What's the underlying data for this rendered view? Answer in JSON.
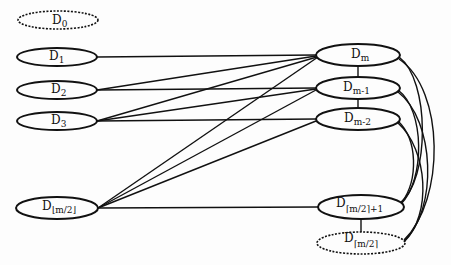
{
  "diagram": {
    "type": "bipartite-graph",
    "left_nodes": [
      {
        "id": "D0",
        "base": "D",
        "sub": "0",
        "style": "dashed"
      },
      {
        "id": "D1",
        "base": "D",
        "sub": "1",
        "style": "solid"
      },
      {
        "id": "D2",
        "base": "D",
        "sub": "2",
        "style": "solid"
      },
      {
        "id": "D3",
        "base": "D",
        "sub": "3",
        "style": "solid"
      },
      {
        "id": "Dfloor",
        "base": "D",
        "sub": "⌊m/2⌋",
        "style": "solid"
      }
    ],
    "right_nodes": [
      {
        "id": "Dm",
        "base": "D",
        "sub": "m",
        "style": "solid"
      },
      {
        "id": "Dm1",
        "base": "D",
        "sub": "m-1",
        "style": "solid"
      },
      {
        "id": "Dm2",
        "base": "D",
        "sub": "m-2",
        "style": "solid"
      },
      {
        "id": "Dceil1",
        "base": "D",
        "sub": "⌈m/2⌉+1",
        "style": "solid"
      },
      {
        "id": "Dceil",
        "base": "D",
        "sub": "⌈m/2⌉",
        "style": "dashed"
      }
    ],
    "edges": [
      [
        "D1",
        "Dm"
      ],
      [
        "D2",
        "Dm"
      ],
      [
        "D2",
        "Dm1"
      ],
      [
        "D3",
        "Dm"
      ],
      [
        "D3",
        "Dm1"
      ],
      [
        "D3",
        "Dm2"
      ],
      [
        "Dfloor",
        "Dm"
      ],
      [
        "Dfloor",
        "Dm1"
      ],
      [
        "Dfloor",
        "Dm2"
      ],
      [
        "Dfloor",
        "Dceil1"
      ],
      [
        "Dm",
        "Dm1"
      ],
      [
        "Dm1",
        "Dm2"
      ],
      [
        "Dceil1",
        "Dceil"
      ],
      [
        "Dm",
        "Dceil1"
      ],
      [
        "Dm",
        "Dceil"
      ],
      [
        "Dm1",
        "Dceil1"
      ],
      [
        "Dm1",
        "Dceil"
      ],
      [
        "Dm2",
        "Dceil1"
      ],
      [
        "Dm2",
        "Dceil"
      ]
    ],
    "colors": {
      "stroke": "#111111",
      "background": "#fdfdfd"
    }
  }
}
